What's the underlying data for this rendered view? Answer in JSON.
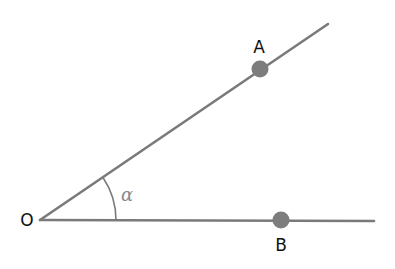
{
  "diagram": {
    "type": "angle",
    "vertex": {
      "label": "O",
      "x": 40,
      "y": 220
    },
    "rays": [
      {
        "name": "ray-OA",
        "x2": 328,
        "y2": 24
      },
      {
        "name": "ray-OB",
        "x2": 374,
        "y2": 221
      }
    ],
    "points": [
      {
        "label": "A",
        "x": 260,
        "y": 69,
        "label_x": 259,
        "label_y": 53
      },
      {
        "label": "B",
        "x": 281,
        "y": 220,
        "label_x": 281,
        "label_y": 250
      }
    ],
    "angle": {
      "label": "α",
      "radius": 76,
      "label_x": 127,
      "label_y": 201
    },
    "colors": {
      "line": "#7a7a7a",
      "point": "#7d7d7d",
      "text": "#111111",
      "angle_label": "#8a8a8a"
    }
  }
}
